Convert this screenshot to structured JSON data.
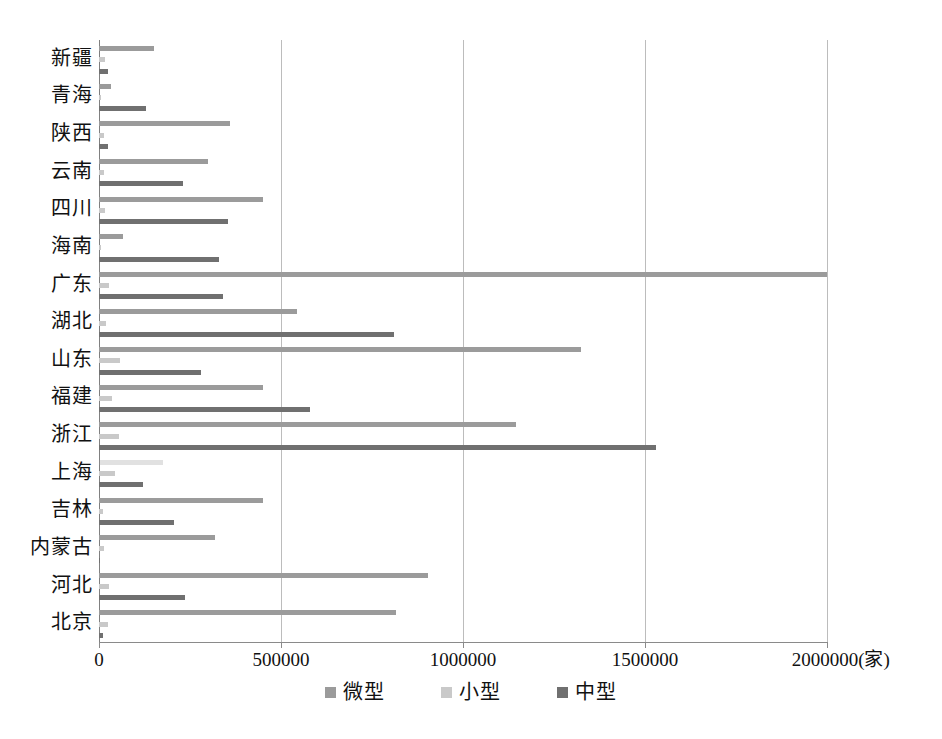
{
  "chart_data": {
    "type": "bar",
    "orientation": "horizontal",
    "title": "",
    "xlabel": "",
    "ylabel": "",
    "unit_label": "(家)",
    "xlim": [
      0,
      2100000
    ],
    "xticks": [
      0,
      500000,
      1000000,
      1500000,
      2000000
    ],
    "xtick_labels": [
      "0",
      "500000",
      "1000000",
      "1500000",
      "2000000(家)"
    ],
    "grid": "vertical",
    "legend_position": "bottom",
    "categories": [
      "新疆",
      "青海",
      "陕西",
      "云南",
      "四川",
      "海南",
      "广东",
      "湖北",
      "山东",
      "福建",
      "浙江",
      "上海",
      "吉林",
      "内蒙古",
      "河北",
      "北京"
    ],
    "series": [
      {
        "name": "微型",
        "color": "#9b9b9b",
        "values": [
          152000,
          33000,
          360000,
          300000,
          450000,
          65000,
          2000000,
          545000,
          1325000,
          450000,
          1145000,
          175000,
          450000,
          320000,
          905000,
          815000
        ]
      },
      {
        "name": "小型",
        "color": "#c9c9c9",
        "values": [
          17000,
          6000,
          14000,
          13000,
          17000,
          5000,
          28000,
          19000,
          58000,
          36000,
          54000,
          44000,
          11000,
          14000,
          27000,
          26000
        ]
      },
      {
        "name": "中型",
        "color": "#707070",
        "values": [
          24000,
          130000,
          25000,
          230000,
          355000,
          330000,
          340000,
          810000,
          280000,
          580000,
          1530000,
          120000,
          205000,
          0,
          235000,
          12000
        ]
      }
    ]
  },
  "legend": {
    "items": [
      {
        "label": "微型",
        "key": "s-micro"
      },
      {
        "label": "小型",
        "key": "s-small"
      },
      {
        "label": "中型",
        "key": "s-medium"
      }
    ]
  }
}
